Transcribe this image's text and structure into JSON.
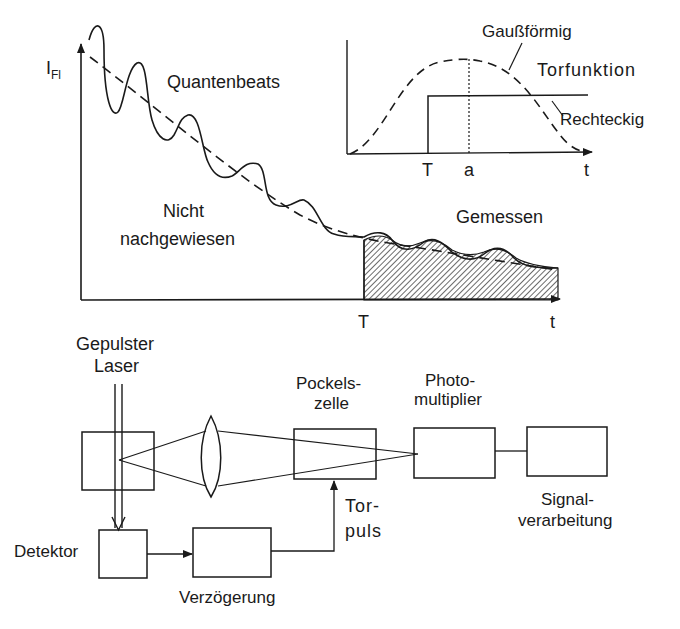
{
  "main_chart": {
    "y_axis_label": "I",
    "y_axis_subscript": "Fl",
    "x_axis_label": "t",
    "gate_time_label": "T",
    "annotations": {
      "quantum_beats": "Quantenbeats",
      "not_detected_line1": "Nicht",
      "not_detected_line2": "nachgewiesen",
      "measured": "Gemessen"
    }
  },
  "inset_chart": {
    "title": "Torfunktion",
    "x_axis_label": "t",
    "tick_T": "T",
    "tick_a": "a",
    "gaussian_label": "Gaußförmig",
    "rectangular_label": "Rechteckig"
  },
  "apparatus": {
    "laser_line1": "Gepulster",
    "laser_line2": "Laser",
    "pockels_line1": "Pockels-",
    "pockels_line2": "zelle",
    "pmt_line1": "Photo-",
    "pmt_line2": "multiplier",
    "signal_line1": "Signal-",
    "signal_line2": "verarbeitung",
    "detector": "Detektor",
    "delay": "Verzögerung",
    "gate_pulse_line1": "Tor-",
    "gate_pulse_line2": "puls"
  },
  "colors": {
    "ink": "#1a1a1a",
    "background": "#ffffff"
  }
}
